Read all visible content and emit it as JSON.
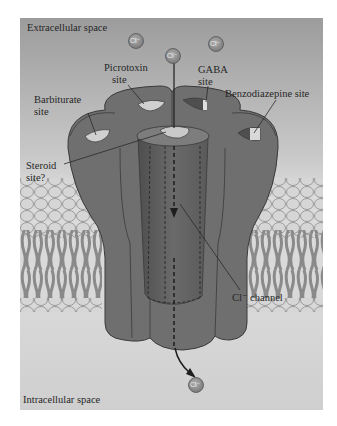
{
  "figure": {
    "regions": {
      "top": "Extracellular space",
      "bottom": "Intracellular space"
    },
    "labels": {
      "picrotoxin": [
        "Picrotoxin",
        "site"
      ],
      "gaba": [
        "GABA",
        "site"
      ],
      "barbiturate": [
        "Barbiturate",
        "site"
      ],
      "benzodiazepine": "Benzodiazepine site",
      "steroid": [
        "Steroid",
        "site?"
      ],
      "channel": "Cl⁻ channel"
    },
    "ion_symbol": "Cl⁻",
    "colors": {
      "background_top": "#9a9a9a",
      "background_bottom": "#d9d9d9",
      "protein": "#6f6f6f",
      "protein_dark": "#555555",
      "lipid_head": "#d6d6d6",
      "lipid_tail": "#8a8a8a",
      "ion_fill": "#8c8c8c",
      "text": "#262626"
    }
  }
}
